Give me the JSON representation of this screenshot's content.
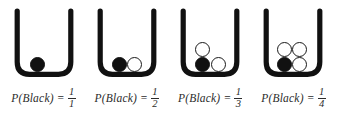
{
  "figure": {
    "name": "probability-urn-series",
    "background_color": "#ffffff",
    "ink_color": "#111111",
    "text_color": "#2b2b2b",
    "panels": [
      {
        "id": "panel-1",
        "total_balls": 1,
        "black_balls": 1,
        "white_balls": 0,
        "caption_text": "P(Black) =",
        "numerator": "1",
        "denominator": "1",
        "balls": [
          {
            "color": "black",
            "left": 16,
            "bottom": 0
          }
        ]
      },
      {
        "id": "panel-2",
        "total_balls": 2,
        "black_balls": 1,
        "white_balls": 1,
        "caption_text": "P(Black) =",
        "numerator": "1",
        "denominator": "2",
        "balls": [
          {
            "color": "black",
            "left": 15,
            "bottom": 0
          },
          {
            "color": "white",
            "left": 30,
            "bottom": 0
          }
        ]
      },
      {
        "id": "panel-3",
        "total_balls": 3,
        "black_balls": 1,
        "white_balls": 2,
        "caption_text": "P(Black) =",
        "numerator": "1",
        "denominator": "3",
        "balls": [
          {
            "color": "black",
            "left": 15,
            "bottom": 0
          },
          {
            "color": "white",
            "left": 31,
            "bottom": 0
          },
          {
            "color": "white",
            "left": 15,
            "bottom": 15
          }
        ]
      },
      {
        "id": "panel-4",
        "total_balls": 4,
        "black_balls": 1,
        "white_balls": 3,
        "caption_text": "P(Black) =",
        "numerator": "1",
        "denominator": "4",
        "balls": [
          {
            "color": "black",
            "left": 14,
            "bottom": 0
          },
          {
            "color": "white",
            "left": 29,
            "bottom": 0
          },
          {
            "color": "white",
            "left": 14,
            "bottom": 15
          },
          {
            "color": "white",
            "left": 29,
            "bottom": 15
          }
        ]
      }
    ]
  }
}
